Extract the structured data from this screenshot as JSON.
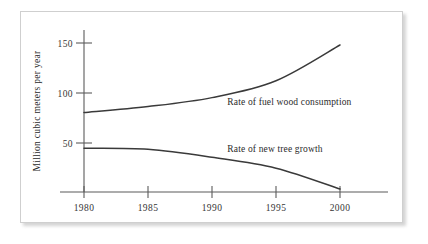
{
  "chart_data": {
    "type": "line",
    "title": "",
    "xlabel": "",
    "ylabel": "Million cubic meters per year",
    "xlim": [
      1980,
      2001
    ],
    "ylim": [
      0,
      160
    ],
    "grid": false,
    "legend_position": "inline-annotation",
    "xticks": [
      "1980",
      "1985",
      "1990",
      "1995",
      "2000"
    ],
    "xtick_values": [
      1980,
      1985,
      1990,
      1995,
      2000
    ],
    "yticks": [
      "50",
      "100",
      "150"
    ],
    "ytick_values": [
      50,
      100,
      150
    ],
    "x": [
      1980,
      1985,
      1990,
      1995,
      2000
    ],
    "series": [
      {
        "name": "Rate of fuel wood consumption",
        "values": [
          80,
          86,
          95,
          112,
          148
        ],
        "label_x": 1991.2,
        "label_y": 88
      },
      {
        "name": "Rate of new tree growth",
        "values": [
          44,
          43,
          35,
          24,
          3
        ],
        "label_x": 1991.2,
        "label_y": 40
      }
    ]
  },
  "figure": {
    "frame_present": true,
    "background_color": "#ffffff",
    "line_color": "#3a3a3a",
    "axis_color": "#5b5b5b",
    "frame_color": "#cfcfcf"
  }
}
